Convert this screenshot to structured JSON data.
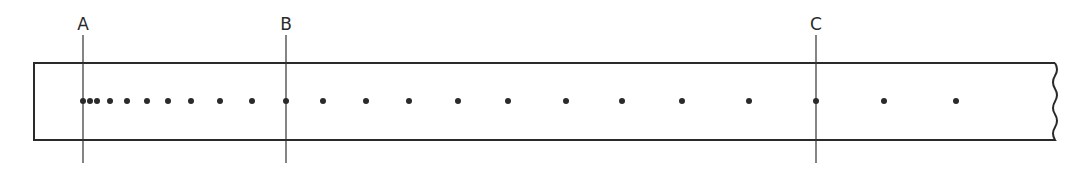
{
  "diagram": {
    "strip": {
      "x1": 34,
      "y1": 63,
      "x2": 1055,
      "y2": 140,
      "stroke": "#2a2a2a",
      "right_edge": "wavy-break"
    },
    "dot_y": 101,
    "dots_x": [
      83,
      90,
      97,
      110,
      127,
      147,
      168,
      191,
      220,
      252,
      286,
      323,
      366,
      409,
      458,
      508,
      566,
      622,
      682,
      749,
      816,
      884,
      956
    ],
    "markers": [
      {
        "label": "A",
        "x": 83
      },
      {
        "label": "B",
        "x": 286
      },
      {
        "label": "C",
        "x": 816
      }
    ],
    "marker_line": {
      "y_top": 35,
      "y_bottom": 163
    }
  }
}
